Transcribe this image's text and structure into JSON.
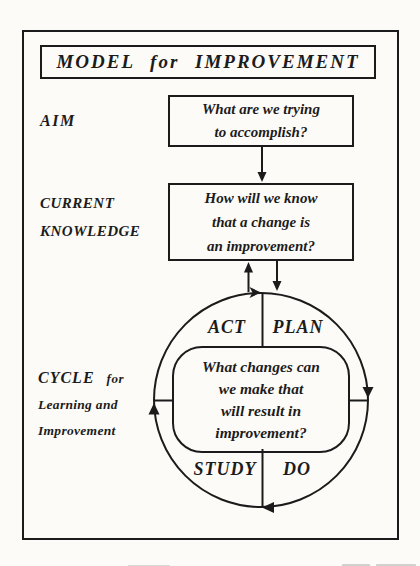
{
  "figure": {
    "title": "MODEL for IMPROVEMENT",
    "rows": {
      "aim": {
        "label": "AIM",
        "box_lines": [
          "What are we trying",
          "to accomplish?"
        ]
      },
      "current_knowledge": {
        "label_lines": [
          "CURRENT",
          "KNOWLEDGE"
        ],
        "box_lines": [
          "How will we know",
          "that a change is",
          "an improvement?"
        ]
      },
      "cycle": {
        "label_word_main": "CYCLE",
        "label_word_suffix": "for",
        "label_lines": [
          "Learning and",
          "Improvement"
        ],
        "quadrants": {
          "top_left": "ACT",
          "top_right": "PLAN",
          "bottom_left": "STUDY",
          "bottom_right": "DO"
        },
        "center_box_lines": [
          "What changes can",
          "we make that",
          "will result in",
          "improvement?"
        ]
      }
    },
    "colors": {
      "ink": "#1b1b1b",
      "paper": "#fcfbf8"
    }
  }
}
